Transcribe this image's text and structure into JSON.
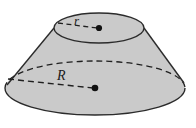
{
  "figure": {
    "kind": "geometry-diagram",
    "shape_name": "truncated-cone-frustum",
    "labels": {
      "top_radius": "r",
      "bottom_radius": "R"
    },
    "colors": {
      "fill": "#cacaca",
      "outline": "#2b2b2b",
      "dash": "#1f1f1f",
      "background": "#ffffff",
      "center_dot": "#111111"
    },
    "geometry": {
      "top_ellipse": {
        "cx": 99,
        "cy": 28,
        "rx": 45,
        "ry": 15
      },
      "bottom_ellipse": {
        "cx": 95,
        "cy": 88,
        "rx": 90,
        "ry": 27
      },
      "left_slant": {
        "x1": 54,
        "y1": 28,
        "x2": 7,
        "y2": 85
      },
      "right_slant": {
        "x1": 144,
        "y1": 28,
        "x2": 184,
        "y2": 83
      },
      "top_radius_line": {
        "x1": 58,
        "y1": 22,
        "x2": 99,
        "y2": 28
      },
      "bottom_radius_line": {
        "x1": 8,
        "y1": 78,
        "x2": 95,
        "y2": 88
      }
    }
  }
}
